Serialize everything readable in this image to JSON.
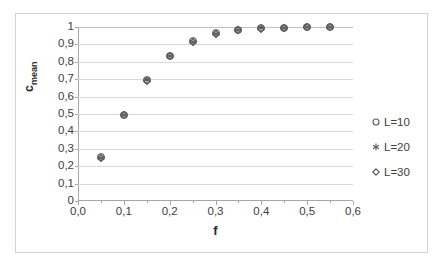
{
  "chart_data": {
    "type": "scatter",
    "title": "",
    "xlabel": "f",
    "ylabel": "c_mean",
    "ylabel_base": "c",
    "ylabel_sub": "mean",
    "xlim": [
      0.0,
      0.6
    ],
    "ylim": [
      0,
      1
    ],
    "grid": true,
    "legend_position": "right",
    "x_ticklabels": [
      "0,0",
      "0,1",
      "0,2",
      "0,3",
      "0,4",
      "0,5",
      "0,6"
    ],
    "x_tickvalues": [
      0.0,
      0.1,
      0.2,
      0.3,
      0.4,
      0.5,
      0.6
    ],
    "x_minor_tickvalues": [
      0.05,
      0.15,
      0.25,
      0.35,
      0.45,
      0.55
    ],
    "y_ticklabels": [
      "1",
      "0,9",
      "0,8",
      "0,7",
      "0,6",
      "0,5",
      "0,4",
      "0,3",
      "0,2",
      "0,1",
      "0"
    ],
    "y_tickvalues": [
      1,
      0.9,
      0.8,
      0.7,
      0.6,
      0.5,
      0.4,
      0.3,
      0.2,
      0.1,
      0
    ],
    "x": [
      0.05,
      0.1,
      0.15,
      0.2,
      0.25,
      0.3,
      0.35,
      0.4,
      0.45,
      0.5,
      0.55
    ],
    "series": [
      {
        "name": "L=10",
        "marker": "circle",
        "values": [
          0.252,
          0.497,
          0.697,
          0.836,
          0.918,
          0.963,
          0.984,
          0.992,
          0.996,
          0.998,
          0.999
        ]
      },
      {
        "name": "L=20",
        "marker": "asterisk",
        "values": [
          0.25,
          0.494,
          0.694,
          0.834,
          0.915,
          0.961,
          0.983,
          0.992,
          0.996,
          0.998,
          0.999
        ]
      },
      {
        "name": "L=30",
        "marker": "diamond",
        "values": [
          0.249,
          0.492,
          0.692,
          0.833,
          0.914,
          0.96,
          0.983,
          0.991,
          0.996,
          0.998,
          0.999
        ]
      }
    ]
  },
  "colors": {
    "marker": "#595959",
    "gridline": "#d9d9d9",
    "axis": "#a6a6a6",
    "frame": "#d3d3d3",
    "text": "#404040",
    "title_text": "#2b2b2b",
    "background": "#ffffff"
  },
  "legend": {
    "items": [
      {
        "label": "L=10",
        "marker": "circle"
      },
      {
        "label": "L=20",
        "marker": "asterisk"
      },
      {
        "label": "L=30",
        "marker": "diamond"
      }
    ]
  }
}
